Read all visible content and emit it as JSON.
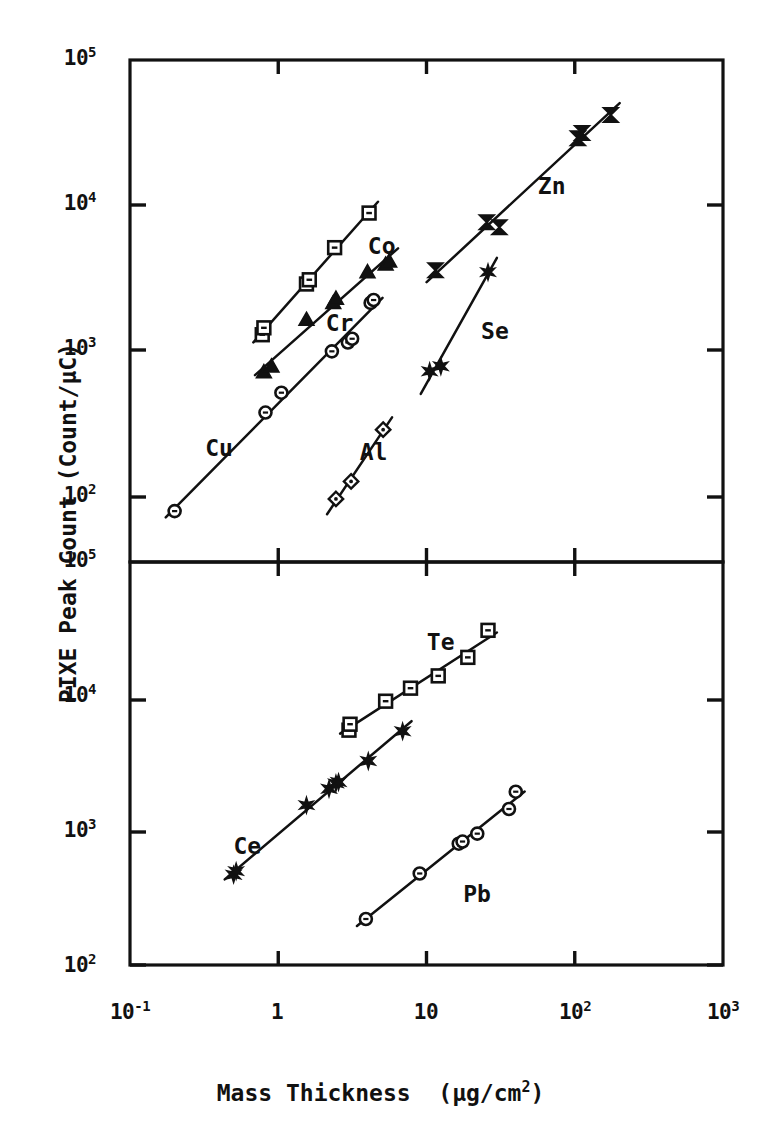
{
  "figure": {
    "xaxis_title_main": "Mass Thickness",
    "xaxis_title_unit_pre": "(μg/cm",
    "xaxis_title_unit_sup": "2",
    "xaxis_title_unit_post": ")",
    "yaxis_title": "PIXE Peak Count  (Count/μC)",
    "ink_color": "#111111",
    "background_color": "#ffffff"
  },
  "chart_data": [
    {
      "type": "scatter",
      "panel": "top",
      "title": "",
      "xlabel": "Mass Thickness (μg/cm2)",
      "ylabel": "PIXE Peak Count (Count/μC)",
      "xscale": "log",
      "yscale": "log",
      "xlim": [
        0.1,
        1000
      ],
      "ylim": [
        100,
        100000
      ],
      "grid": false,
      "legend": "inline-labels",
      "xticklabels": [
        "10-1",
        "1",
        "10",
        "102",
        "103"
      ],
      "yticklabels": [
        "102",
        "103",
        "104",
        "105"
      ],
      "series": [
        {
          "name": "Cr",
          "marker": "open-square",
          "label_x": 2.6,
          "label_y": 1550,
          "points": [
            {
              "x": 0.78,
              "y": 1300
            },
            {
              "x": 0.8,
              "y": 1450
            },
            {
              "x": 1.55,
              "y": 2900
            },
            {
              "x": 1.62,
              "y": 3100
            },
            {
              "x": 2.4,
              "y": 5150
            },
            {
              "x": 4.1,
              "y": 8900
            }
          ]
        },
        {
          "name": "Co",
          "marker": "solid-triangle",
          "label_x": 5.0,
          "label_y": 5200,
          "points": [
            {
              "x": 0.8,
              "y": 720
            },
            {
              "x": 0.9,
              "y": 790
            },
            {
              "x": 1.55,
              "y": 1650
            },
            {
              "x": 2.35,
              "y": 2150
            },
            {
              "x": 2.45,
              "y": 2300
            },
            {
              "x": 4.0,
              "y": 3500
            },
            {
              "x": 5.3,
              "y": 3950
            },
            {
              "x": 5.6,
              "y": 4150
            }
          ]
        },
        {
          "name": "Cu",
          "marker": "open-circle",
          "label_x": 0.4,
          "label_y": 215,
          "points": [
            {
              "x": 0.2,
              "y": 80
            },
            {
              "x": 0.82,
              "y": 380
            },
            {
              "x": 1.05,
              "y": 520
            },
            {
              "x": 2.3,
              "y": 1000
            },
            {
              "x": 2.95,
              "y": 1150
            },
            {
              "x": 3.15,
              "y": 1220
            },
            {
              "x": 4.2,
              "y": 2150
            },
            {
              "x": 4.4,
              "y": 2250
            }
          ]
        },
        {
          "name": "Al",
          "marker": "open-diamond",
          "label_x": 4.4,
          "label_y": 200,
          "points": [
            {
              "x": 2.45,
              "y": 97
            },
            {
              "x": 3.1,
              "y": 128
            },
            {
              "x": 5.1,
              "y": 290
            }
          ]
        },
        {
          "name": "Zn",
          "marker": "solid-bowtie",
          "label_x": 70,
          "label_y": 13500,
          "points": [
            {
              "x": 11.5,
              "y": 3600
            },
            {
              "x": 25.5,
              "y": 7700
            },
            {
              "x": 31.0,
              "y": 7100
            },
            {
              "x": 105.0,
              "y": 29000
            },
            {
              "x": 112.0,
              "y": 31500
            },
            {
              "x": 175.0,
              "y": 42000
            }
          ]
        },
        {
          "name": "Se",
          "marker": "solid-star",
          "label_x": 29,
          "label_y": 1350,
          "points": [
            {
              "x": 10.5,
              "y": 730
            },
            {
              "x": 12.5,
              "y": 790
            },
            {
              "x": 26.0,
              "y": 3500
            }
          ]
        }
      ]
    },
    {
      "type": "scatter",
      "panel": "bottom",
      "title": "",
      "xlabel": "Mass Thickness (μg/cm2)",
      "ylabel": "PIXE Peak Count (Count/μC)",
      "xscale": "log",
      "yscale": "log",
      "xlim": [
        0.1,
        1000
      ],
      "ylim": [
        100,
        100000
      ],
      "grid": false,
      "legend": "inline-labels",
      "xticklabels": [
        "10-1",
        "1",
        "10",
        "102",
        "103"
      ],
      "yticklabels": [
        "102",
        "103",
        "104",
        "105"
      ],
      "series": [
        {
          "name": "Te",
          "marker": "open-square",
          "label_x": 12.5,
          "label_y": 25000,
          "points": [
            {
              "x": 3.0,
              "y": 5600
            },
            {
              "x": 3.05,
              "y": 6200
            },
            {
              "x": 5.3,
              "y": 9200
            },
            {
              "x": 7.8,
              "y": 11500
            },
            {
              "x": 12.0,
              "y": 14200
            },
            {
              "x": 19.0,
              "y": 19500
            },
            {
              "x": 26.0,
              "y": 31000
            }
          ]
        },
        {
          "name": "Ce",
          "marker": "solid-star",
          "label_x": 0.62,
          "label_y": 760,
          "points": [
            {
              "x": 0.5,
              "y": 470
            },
            {
              "x": 0.52,
              "y": 500
            },
            {
              "x": 1.55,
              "y": 1550
            },
            {
              "x": 2.2,
              "y": 2050
            },
            {
              "x": 2.45,
              "y": 2250
            },
            {
              "x": 2.55,
              "y": 2300
            },
            {
              "x": 4.05,
              "y": 3300
            },
            {
              "x": 6.9,
              "y": 5500
            }
          ]
        },
        {
          "name": "Pb",
          "marker": "open-circle",
          "label_x": 22,
          "label_y": 330,
          "points": [
            {
              "x": 3.9,
              "y": 220
            },
            {
              "x": 9.0,
              "y": 480
            },
            {
              "x": 16.5,
              "y": 800
            },
            {
              "x": 17.5,
              "y": 830
            },
            {
              "x": 22.0,
              "y": 950
            },
            {
              "x": 36.0,
              "y": 1450
            },
            {
              "x": 40.0,
              "y": 1950
            }
          ]
        }
      ]
    }
  ],
  "axes": {
    "top_panel": {
      "ytick_labels": [
        {
          "base": "10",
          "exp": "5"
        },
        {
          "base": "10",
          "exp": "4"
        },
        {
          "base": "10",
          "exp": "3"
        },
        {
          "base": "10",
          "exp": "2"
        }
      ]
    },
    "bottom_panel": {
      "ytick_labels": [
        {
          "base": "10",
          "exp": "5"
        },
        {
          "base": "10",
          "exp": "4"
        },
        {
          "base": "10",
          "exp": "3"
        },
        {
          "base": "10",
          "exp": "2"
        }
      ]
    },
    "xtick_labels": [
      {
        "base": "10",
        "exp": "-1"
      },
      {
        "base": "1",
        "exp": ""
      },
      {
        "base": "10",
        "exp": ""
      },
      {
        "base": "10",
        "exp": "2"
      },
      {
        "base": "10",
        "exp": "3"
      }
    ]
  }
}
